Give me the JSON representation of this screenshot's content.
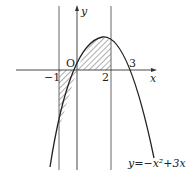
{
  "diagram": {
    "function_label": "y=−x²+3x",
    "axis_x_label": "x",
    "axis_y_label": "y",
    "origin_label": "O",
    "tick_labels": {
      "neg_one": "−1",
      "two": "2",
      "three": "3"
    },
    "vertical_lines_at": [
      -1,
      0,
      2
    ],
    "shaded_region": {
      "from": -1,
      "to": 2
    },
    "colors": {
      "stroke": "#222222",
      "guide": "#555555"
    }
  }
}
